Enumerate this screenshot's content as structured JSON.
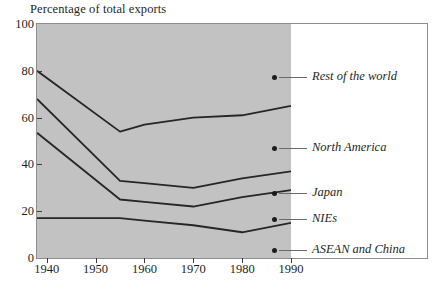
{
  "chart": {
    "title": "Percentage of total exports",
    "background_color": "#c2c2c2",
    "line_color": "#262626",
    "frame_color": "#8d8d8d"
  },
  "chart_data": {
    "type": "line",
    "title": "Percentage of total exports",
    "xlabel": "",
    "ylabel": "Percentage of total exports",
    "xlim": [
      1938,
      1990
    ],
    "ylim": [
      0,
      100
    ],
    "grid": false,
    "legend_position": "right",
    "x": [
      1938,
      1955,
      1960,
      1970,
      1980,
      1990
    ],
    "xticks": [
      1940,
      1950,
      1960,
      1970,
      1980,
      1990
    ],
    "yticks": [
      0,
      20,
      40,
      60,
      80,
      100
    ],
    "series": [
      {
        "name": "Rest of the world",
        "values": [
          80,
          54,
          57,
          60,
          61,
          65
        ]
      },
      {
        "name": "North America",
        "values": [
          68,
          33,
          32,
          30,
          34,
          37
        ]
      },
      {
        "name": "Japan",
        "values": [
          53.5,
          25,
          24,
          22,
          26,
          29
        ]
      },
      {
        "name": "NIEs",
        "values": [
          17,
          17,
          16,
          14,
          11,
          15
        ]
      },
      {
        "name": "ASEAN and China",
        "values": [
          0,
          0,
          0,
          0,
          0,
          0
        ]
      }
    ]
  },
  "y_axis": {
    "ticks": [
      {
        "label": "100",
        "value": 100
      },
      {
        "label": "80",
        "value": 80
      },
      {
        "label": "60",
        "value": 60
      },
      {
        "label": "40",
        "value": 40
      },
      {
        "label": "20",
        "value": 20
      },
      {
        "label": "0",
        "value": 0
      }
    ]
  },
  "x_axis": {
    "ticks": [
      {
        "label": "1940",
        "value": 1940
      },
      {
        "label": "1950",
        "value": 1950
      },
      {
        "label": "1960",
        "value": 1960
      },
      {
        "label": "1970",
        "value": 1970
      },
      {
        "label": "1980",
        "value": 1980
      },
      {
        "label": "1990",
        "value": 1990
      }
    ]
  },
  "legend": {
    "entries": [
      {
        "label": "Rest of the world",
        "y": 70
      },
      {
        "label": "North America",
        "y": 141
      },
      {
        "label": "Japan",
        "y": 186
      },
      {
        "label": "NIEs",
        "y": 212
      },
      {
        "label": "ASEAN and China",
        "y": 243
      }
    ]
  }
}
